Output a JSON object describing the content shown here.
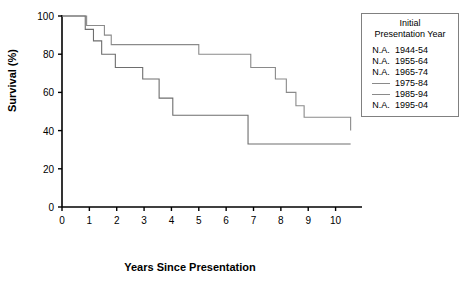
{
  "chart_data": {
    "type": "line",
    "title": "",
    "xlabel": "Years Since Presentation",
    "ylabel": "Survival (%)",
    "xlim": [
      0,
      10.6
    ],
    "ylim": [
      0,
      100
    ],
    "xticks": [
      "0",
      "1",
      "2",
      "3",
      "4",
      "5",
      "6",
      "7",
      "8",
      "9",
      "10"
    ],
    "yticks": [
      "0",
      "20",
      "40",
      "60",
      "80",
      "100"
    ],
    "grid": false,
    "legend_position": "top-right",
    "step_style": "post",
    "series": [
      {
        "name": "1975-84",
        "color": "#8a8a8a",
        "available": true,
        "x": [
          0,
          0.55,
          0.9,
          1.25,
          1.55,
          1.8,
          5.0,
          5.6,
          6.9,
          7.35,
          7.8,
          8.2,
          8.55,
          8.85,
          10.55
        ],
        "y": [
          100,
          100,
          95,
          95,
          90,
          85,
          80,
          80,
          73,
          73,
          67,
          60,
          53,
          47,
          40
        ]
      },
      {
        "name": "1985-94",
        "color": "#6e6e6e",
        "available": true,
        "x": [
          0,
          0.5,
          0.85,
          1.15,
          1.45,
          1.95,
          2.45,
          2.95,
          3.55,
          4.05,
          6.45,
          6.8,
          10.55
        ],
        "y": [
          100,
          100,
          93,
          87,
          80,
          73,
          73,
          67,
          57,
          48,
          48,
          33,
          33
        ]
      }
    ]
  },
  "legend": {
    "title_line1": "Initial",
    "title_line2": "Presentation Year",
    "na_label": "N.A.",
    "entries": [
      {
        "marker": "na",
        "label": "1944-54"
      },
      {
        "marker": "na",
        "label": "1955-64"
      },
      {
        "marker": "na",
        "label": "1965-74"
      },
      {
        "marker": "line",
        "label": "1975-84"
      },
      {
        "marker": "line",
        "label": "1985-94"
      },
      {
        "marker": "na",
        "label": "1995-04"
      }
    ]
  }
}
